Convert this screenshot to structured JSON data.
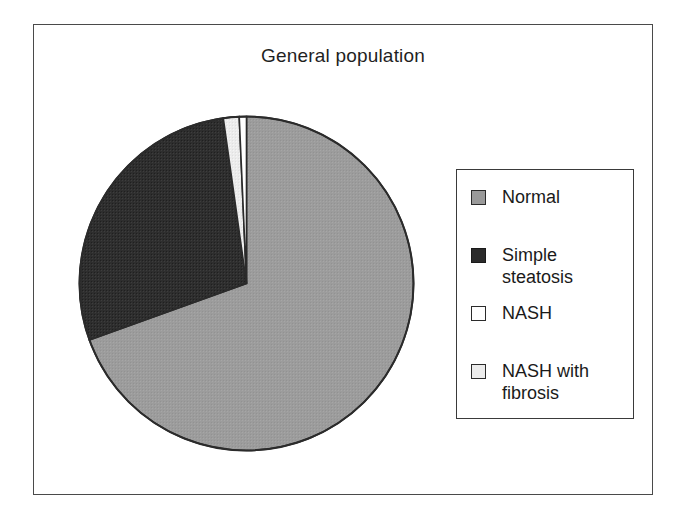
{
  "figure": {
    "title": "General population",
    "frame_border_color": "#4a4a4a",
    "background": "#ffffff"
  },
  "legend": {
    "position": "right",
    "border_color": "#3a3a3a",
    "items": [
      {
        "label": "Normal",
        "color": "#9a9a9a",
        "swatch_border": "#2b2b2b"
      },
      {
        "label": "Simple steatosis",
        "color": "#2b2b2b",
        "swatch_border": "#1a1a1a"
      },
      {
        "label": "NASH",
        "color": "#ffffff",
        "swatch_border": "#2b2b2b"
      },
      {
        "label": "NASH with\nfibrosis",
        "color": "#ececec",
        "swatch_border": "#2b2b2b"
      }
    ]
  },
  "chart_data": {
    "type": "pie",
    "title": "General population",
    "xlabel": "",
    "ylabel": "",
    "legend_position": "right",
    "grid": false,
    "start_angle_deg": 0,
    "direction": "clockwise",
    "categories": [
      "Normal",
      "Simple steatosis",
      "NASH",
      "NASH with fibrosis"
    ],
    "values": [
      69.5,
      28.3,
      0.7,
      1.5
    ],
    "unit": "percent",
    "colors": [
      "#9a9a9a",
      "#2b2b2b",
      "#ffffff",
      "#ececec"
    ],
    "slice_angles_deg": [
      250.2,
      101.8,
      2.5,
      5.5
    ],
    "slices": [
      {
        "label": "Normal",
        "value": 69.5,
        "color": "#9a9a9a",
        "start_deg": 0.0,
        "end_deg": 250.2
      },
      {
        "label": "Simple steatosis",
        "value": 28.3,
        "color": "#2b2b2b",
        "start_deg": 250.2,
        "end_deg": 352.0
      },
      {
        "label": "NASH with fibrosis",
        "value": 1.5,
        "color": "#ececec",
        "start_deg": 352.0,
        "end_deg": 357.5
      },
      {
        "label": "NASH",
        "value": 0.7,
        "color": "#ffffff",
        "start_deg": 357.5,
        "end_deg": 360.0
      }
    ]
  },
  "geometry": {
    "center_x": 172.5,
    "center_y": 172.5,
    "radius": 167
  }
}
